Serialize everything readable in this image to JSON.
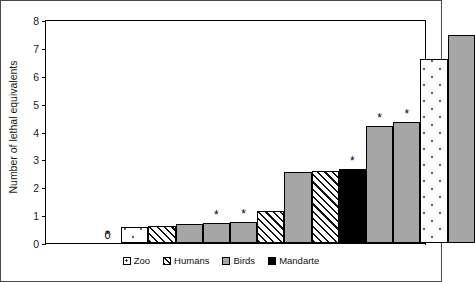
{
  "chart_data": {
    "type": "bar",
    "title": "",
    "xlabel": "",
    "ylabel": "Number of lethal equivalents",
    "ylim": [
      0,
      8
    ],
    "yticks": [
      0,
      1,
      2,
      3,
      4,
      5,
      6,
      7,
      8
    ],
    "ytick_labels": [
      "0",
      "1",
      "2",
      "3",
      "4",
      "5",
      "6",
      "7",
      "8"
    ],
    "grid": false,
    "legend_position": "bottom",
    "xtick_labels": [],
    "categories": [
      "1",
      "2",
      "3",
      "4",
      "5",
      "6",
      "7",
      "8",
      "9",
      "10",
      "11",
      "12",
      "13",
      "14"
    ],
    "values": [
      0,
      0.57,
      0.62,
      0.7,
      0.72,
      0.75,
      1.15,
      2.55,
      2.6,
      2.65,
      4.2,
      4.35,
      6.6,
      7.45
    ],
    "groups": [
      "Birds",
      "Zoo",
      "Humans",
      "Birds",
      "Birds",
      "Birds",
      "Humans",
      "Birds",
      "Humans",
      "Mandarte",
      "Birds",
      "Birds",
      "Zoo",
      "Birds"
    ],
    "annotations": [
      {
        "bar": 1,
        "text": "*"
      },
      {
        "bar": 5,
        "text": "*"
      },
      {
        "bar": 6,
        "text": "*"
      },
      {
        "bar": 10,
        "text": "*"
      },
      {
        "bar": 11,
        "text": "*"
      },
      {
        "bar": 12,
        "text": "*"
      }
    ],
    "value_labels": [
      {
        "bar": 1,
        "text": "0"
      }
    ],
    "series": [
      {
        "name": "Zoo",
        "pattern": "dotted",
        "color": "#ffffff"
      },
      {
        "name": "Humans",
        "pattern": "hatched",
        "color": "#ffffff"
      },
      {
        "name": "Birds",
        "pattern": "solid",
        "color": "#a6a6a6"
      },
      {
        "name": "Mandarte",
        "pattern": "solid",
        "color": "#000000"
      }
    ]
  },
  "legend": {
    "items": [
      {
        "label": "Zoo",
        "style": "dots"
      },
      {
        "label": "Humans",
        "style": "hatch"
      },
      {
        "label": "Birds",
        "style": "gray"
      },
      {
        "label": "Mandarte",
        "style": "black"
      }
    ]
  },
  "axis": {
    "y_title": "Number of lethal equivalents"
  }
}
